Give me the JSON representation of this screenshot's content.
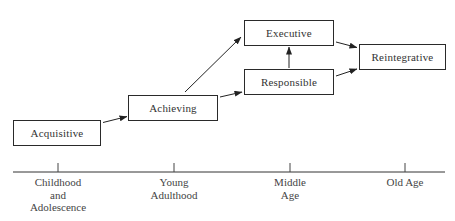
{
  "diagram": {
    "type": "stage-progression",
    "stages": [
      {
        "id": "acquisitive",
        "label": "Acquisitive"
      },
      {
        "id": "achieving",
        "label": "Achieving"
      },
      {
        "id": "executive",
        "label": "Executive"
      },
      {
        "id": "responsible",
        "label": "Responsible"
      },
      {
        "id": "reintegrative",
        "label": "Reintegrative"
      }
    ],
    "edges": [
      {
        "from": "acquisitive",
        "to": "achieving"
      },
      {
        "from": "achieving",
        "to": "executive"
      },
      {
        "from": "achieving",
        "to": "responsible"
      },
      {
        "from": "responsible",
        "to": "executive"
      },
      {
        "from": "executive",
        "to": "reintegrative"
      },
      {
        "from": "responsible",
        "to": "reintegrative"
      }
    ],
    "timeline": {
      "labels": [
        {
          "lines": [
            "Childhood",
            "and",
            "Adolescence"
          ]
        },
        {
          "lines": [
            "Young",
            "Adulthood"
          ]
        },
        {
          "lines": [
            "Middle",
            "Age"
          ]
        },
        {
          "lines": [
            "Old Age"
          ]
        }
      ]
    }
  }
}
